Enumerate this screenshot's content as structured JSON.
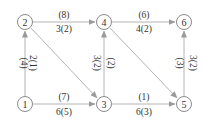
{
  "diagram": {
    "type": "directed-flow-network",
    "nodes": [
      {
        "id": "1",
        "label": "1",
        "x": 25,
        "y": 104
      },
      {
        "id": "2",
        "label": "2",
        "x": 25,
        "y": 22
      },
      {
        "id": "3",
        "label": "3",
        "x": 104,
        "y": 104
      },
      {
        "id": "4",
        "label": "4",
        "x": 104,
        "y": 22
      },
      {
        "id": "5",
        "label": "5",
        "x": 184,
        "y": 104
      },
      {
        "id": "6",
        "label": "6",
        "x": 184,
        "y": 22
      }
    ],
    "edges": [
      {
        "from": "1",
        "to": "2",
        "capacity": "(4)",
        "flow": "2(1)"
      },
      {
        "from": "2",
        "to": "4",
        "capacity": "(8)",
        "flow": "3(2)"
      },
      {
        "from": "4",
        "to": "6",
        "capacity": "(6)",
        "flow": "4(2)"
      },
      {
        "from": "1",
        "to": "3",
        "capacity": "(7)",
        "flow": "6(5)"
      },
      {
        "from": "3",
        "to": "5",
        "capacity": "(1)",
        "flow": "6(3)"
      },
      {
        "from": "3",
        "to": "4",
        "capacity": "(2)",
        "flow": "3(2)"
      },
      {
        "from": "5",
        "to": "6",
        "capacity": "(3)",
        "flow": "3(2)"
      },
      {
        "from": "2",
        "to": "3",
        "capacity": "",
        "flow": ""
      },
      {
        "from": "4",
        "to": "5",
        "capacity": "",
        "flow": ""
      }
    ],
    "colors": {
      "edge": "#b4b4b4",
      "node_stroke": "#8a8a8a",
      "text": "#333333"
    }
  }
}
